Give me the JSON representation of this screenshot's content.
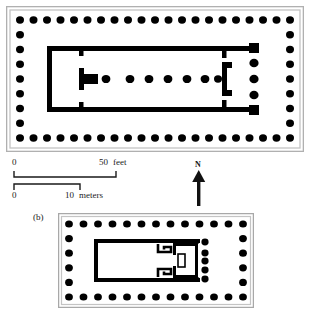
{
  "figure": {
    "type": "architectural-floor-plan",
    "background_color": "#ffffff",
    "ink_color": "#000000",
    "frame_color": "#b4b4b4"
  },
  "plan_a": {
    "label": "",
    "frame": {
      "outer_border_color": "#b4b4b4",
      "inner_border_color": "#c8c8c8"
    },
    "peristyle": {
      "columns_top": 21,
      "columns_bottom": 21,
      "columns_left": 9,
      "columns_right": 9,
      "column_color": "#000000"
    },
    "cella": {
      "wall_color": "#000000",
      "interior_columns": 7,
      "porch_columns": 3,
      "statue_base": "T-shaped"
    }
  },
  "plan_b": {
    "label": "(b)",
    "peristyle": {
      "columns_top": 13,
      "columns_bottom": 13,
      "columns_left": 6,
      "columns_right": 6
    },
    "cella": {
      "wall_color": "#000000",
      "porch_columns": 5,
      "interior_motif": "meander"
    }
  },
  "scale": {
    "feet": {
      "start_label": "0",
      "end_label": "50",
      "unit_label": "feet"
    },
    "meters": {
      "start_label": "0",
      "end_label": "10",
      "unit_label": "meters"
    }
  },
  "north_indicator": {
    "label": "N",
    "direction": "up"
  }
}
